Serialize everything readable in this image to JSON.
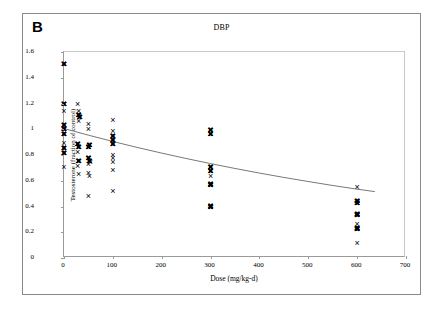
{
  "figure": {
    "panel_label": "B",
    "title": "DBP"
  },
  "chart_data": {
    "type": "scatter",
    "title": "DBP",
    "xlabel": "Dose (mg/kg-d)",
    "ylabel": "Testosterone (fraction of control)",
    "xlim": [
      0,
      700
    ],
    "ylim": [
      0,
      1.6
    ],
    "xticks": [
      0,
      100,
      200,
      300,
      400,
      500,
      600,
      700
    ],
    "yticks": [
      0,
      0.2,
      0.4,
      0.6,
      0.8,
      1,
      1.2,
      1.4,
      1.6
    ],
    "xtick_labels": [
      "0",
      "100",
      "200",
      "300",
      "400",
      "500",
      "600",
      "700"
    ],
    "ytick_labels": [
      "0",
      "0.2",
      "0.4",
      "0.6",
      "0.8",
      "1",
      "1.2",
      "1.4",
      "1.6"
    ],
    "grid": false,
    "legend": null,
    "marker": "x",
    "marker_color": "#000000",
    "series": [
      {
        "name": "Testosterone observations",
        "points": [
          {
            "x": 0,
            "y": 1.5,
            "bold": true
          },
          {
            "x": 0,
            "y": 1.19,
            "bold": true
          },
          {
            "x": 0,
            "y": 1.14,
            "bold": false
          },
          {
            "x": 0,
            "y": 1.03,
            "bold": true
          },
          {
            "x": 0,
            "y": 1.0,
            "bold": true
          },
          {
            "x": 0,
            "y": 0.96,
            "bold": true
          },
          {
            "x": 0,
            "y": 0.89,
            "bold": false
          },
          {
            "x": 0,
            "y": 0.85,
            "bold": true
          },
          {
            "x": 0,
            "y": 0.81,
            "bold": true
          },
          {
            "x": 0,
            "y": 0.7,
            "bold": false
          },
          {
            "x": 28,
            "y": 1.19,
            "bold": false
          },
          {
            "x": 30,
            "y": 1.14,
            "bold": false
          },
          {
            "x": 30,
            "y": 1.11,
            "bold": true
          },
          {
            "x": 32,
            "y": 1.09,
            "bold": true
          },
          {
            "x": 30,
            "y": 1.06,
            "bold": false
          },
          {
            "x": 28,
            "y": 0.88,
            "bold": true
          },
          {
            "x": 30,
            "y": 0.86,
            "bold": true
          },
          {
            "x": 28,
            "y": 0.82,
            "bold": false
          },
          {
            "x": 30,
            "y": 0.75,
            "bold": true
          },
          {
            "x": 28,
            "y": 0.71,
            "bold": false
          },
          {
            "x": 30,
            "y": 0.65,
            "bold": false
          },
          {
            "x": 50,
            "y": 1.04,
            "bold": false
          },
          {
            "x": 50,
            "y": 1.0,
            "bold": false
          },
          {
            "x": 52,
            "y": 0.87,
            "bold": true
          },
          {
            "x": 50,
            "y": 0.86,
            "bold": true
          },
          {
            "x": 50,
            "y": 0.77,
            "bold": true
          },
          {
            "x": 52,
            "y": 0.75,
            "bold": true
          },
          {
            "x": 50,
            "y": 0.73,
            "bold": false
          },
          {
            "x": 54,
            "y": 0.74,
            "bold": false
          },
          {
            "x": 50,
            "y": 0.66,
            "bold": false
          },
          {
            "x": 52,
            "y": 0.63,
            "bold": false
          },
          {
            "x": 50,
            "y": 0.48,
            "bold": false
          },
          {
            "x": 100,
            "y": 1.07,
            "bold": false
          },
          {
            "x": 100,
            "y": 0.98,
            "bold": false
          },
          {
            "x": 100,
            "y": 0.94,
            "bold": true
          },
          {
            "x": 100,
            "y": 0.91,
            "bold": true
          },
          {
            "x": 100,
            "y": 0.88,
            "bold": true
          },
          {
            "x": 100,
            "y": 0.8,
            "bold": false
          },
          {
            "x": 100,
            "y": 0.77,
            "bold": false
          },
          {
            "x": 100,
            "y": 0.74,
            "bold": false
          },
          {
            "x": 100,
            "y": 0.68,
            "bold": false
          },
          {
            "x": 100,
            "y": 0.52,
            "bold": false
          },
          {
            "x": 300,
            "y": 0.99,
            "bold": true
          },
          {
            "x": 300,
            "y": 0.96,
            "bold": true
          },
          {
            "x": 300,
            "y": 0.7,
            "bold": true
          },
          {
            "x": 300,
            "y": 0.67,
            "bold": true
          },
          {
            "x": 300,
            "y": 0.63,
            "bold": false
          },
          {
            "x": 300,
            "y": 0.57,
            "bold": true
          },
          {
            "x": 300,
            "y": 0.56,
            "bold": true
          },
          {
            "x": 300,
            "y": 0.4,
            "bold": true
          },
          {
            "x": 300,
            "y": 0.39,
            "bold": true
          },
          {
            "x": 600,
            "y": 0.55,
            "bold": false
          },
          {
            "x": 600,
            "y": 0.44,
            "bold": true
          },
          {
            "x": 600,
            "y": 0.42,
            "bold": true
          },
          {
            "x": 600,
            "y": 0.34,
            "bold": true
          },
          {
            "x": 600,
            "y": 0.33,
            "bold": true
          },
          {
            "x": 600,
            "y": 0.26,
            "bold": false
          },
          {
            "x": 600,
            "y": 0.23,
            "bold": true
          },
          {
            "x": 600,
            "y": 0.22,
            "bold": true
          },
          {
            "x": 600,
            "y": 0.11,
            "bold": false
          }
        ]
      }
    ],
    "fit_curve": {
      "name": "fitted dose-response curve",
      "color": "#555555",
      "points": [
        {
          "x": 0,
          "y": 1.0
        },
        {
          "x": 50,
          "y": 0.948
        },
        {
          "x": 100,
          "y": 0.899
        },
        {
          "x": 150,
          "y": 0.852
        },
        {
          "x": 200,
          "y": 0.808
        },
        {
          "x": 250,
          "y": 0.766
        },
        {
          "x": 300,
          "y": 0.726
        },
        {
          "x": 350,
          "y": 0.688
        },
        {
          "x": 400,
          "y": 0.652
        },
        {
          "x": 450,
          "y": 0.618
        },
        {
          "x": 500,
          "y": 0.586
        },
        {
          "x": 550,
          "y": 0.555
        },
        {
          "x": 600,
          "y": 0.526
        },
        {
          "x": 640,
          "y": 0.505
        }
      ]
    }
  }
}
